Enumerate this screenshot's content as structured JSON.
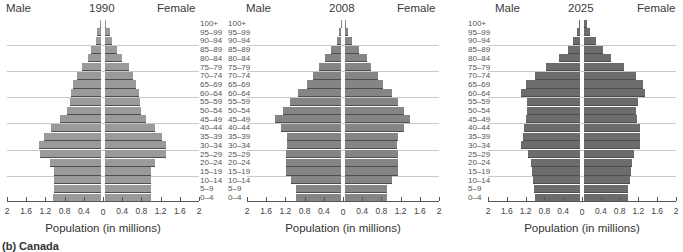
{
  "chart_data": [
    {
      "type": "bar",
      "orientation": "horizontal-pyramid",
      "title": "1990",
      "xlabel": "Population (in millions)",
      "left_label": "Male",
      "right_label": "Female",
      "xlim": [
        -2,
        2
      ],
      "x_ticks": [
        "2",
        "1.6",
        "1.2",
        "0.8",
        "0.4",
        "0",
        "0.4",
        "0.8",
        "1.2",
        "1.6",
        "2"
      ],
      "categories": [
        "100+",
        "95–99",
        "90–94",
        "85–89",
        "80–84",
        "75–79",
        "70–74",
        "65–69",
        "60–64",
        "55–59",
        "50–54",
        "45–49",
        "40–44",
        "35–39",
        "30–34",
        "25–29",
        "20–24",
        "15–19",
        "10–14",
        "5–9",
        "0–4"
      ],
      "series": [
        {
          "name": "Male",
          "values": [
            0.02,
            0.08,
            0.1,
            0.2,
            0.28,
            0.4,
            0.5,
            0.58,
            0.62,
            0.65,
            0.7,
            0.85,
            1.05,
            1.18,
            1.3,
            1.28,
            1.07,
            0.98,
            0.98,
            0.98,
            1.0
          ]
        },
        {
          "name": "Female",
          "values": [
            0.03,
            0.1,
            0.15,
            0.25,
            0.35,
            0.5,
            0.58,
            0.65,
            0.7,
            0.72,
            0.75,
            0.85,
            1.05,
            1.18,
            1.28,
            1.27,
            1.05,
            0.95,
            0.95,
            0.95,
            0.95
          ]
        }
      ],
      "bar_color": "#9a9a9a"
    },
    {
      "type": "bar",
      "orientation": "horizontal-pyramid",
      "title": "2008",
      "xlabel": "Population (in millions)",
      "left_label": "Male",
      "right_label": "Female",
      "xlim": [
        -2,
        2
      ],
      "x_ticks": [
        "2",
        "1.6",
        "1.2",
        "0.8",
        "0.4",
        "0",
        "0.4",
        "0.8",
        "1.2",
        "1.6",
        "2"
      ],
      "categories": [
        "100+",
        "95–99",
        "90–94",
        "85–89",
        "80–84",
        "75–79",
        "70–74",
        "65–69",
        "60–64",
        "55–59",
        "50–54",
        "45–49",
        "40–44",
        "35–39",
        "30–34",
        "25–29",
        "20–24",
        "15–19",
        "10–14",
        "5–9",
        "0–4"
      ],
      "series": [
        {
          "name": "Male",
          "values": [
            0.01,
            0.05,
            0.08,
            0.2,
            0.33,
            0.45,
            0.58,
            0.7,
            0.9,
            1.07,
            1.2,
            1.38,
            1.25,
            1.13,
            1.12,
            1.15,
            1.15,
            1.15,
            1.05,
            0.93,
            0.93
          ]
        },
        {
          "name": "Female",
          "values": [
            0.02,
            0.07,
            0.15,
            0.3,
            0.45,
            0.55,
            0.68,
            0.8,
            0.98,
            1.1,
            1.23,
            1.35,
            1.22,
            1.1,
            1.08,
            1.1,
            1.1,
            1.1,
            0.98,
            0.87,
            0.87
          ]
        }
      ],
      "bar_color": "#858585"
    },
    {
      "type": "bar",
      "orientation": "horizontal-pyramid",
      "title": "2025",
      "xlabel": "Population (in millions)",
      "left_label": "Male",
      "right_label": "Female",
      "xlim": [
        -2,
        2
      ],
      "x_ticks": [
        "2",
        "1.6",
        "1.2",
        "0.8",
        "0.4",
        "0",
        "0.4",
        "0.8",
        "1.2",
        "1.6",
        "2"
      ],
      "categories": [
        "100+",
        "95–99",
        "90–94",
        "85–89",
        "80–84",
        "75–79",
        "70–74",
        "65–69",
        "60–64",
        "55–59",
        "50–54",
        "45–49",
        "40–44",
        "35–39",
        "30–34",
        "25–29",
        "20–24",
        "15–19",
        "10–14",
        "5–9",
        "0–4"
      ],
      "series": [
        {
          "name": "Male",
          "values": [
            0.03,
            0.07,
            0.15,
            0.25,
            0.45,
            0.73,
            0.95,
            1.15,
            1.25,
            1.13,
            1.13,
            1.15,
            1.2,
            1.22,
            1.25,
            1.1,
            1.05,
            1.02,
            1.0,
            0.98,
            0.95
          ]
        },
        {
          "name": "Female",
          "values": [
            0.06,
            0.12,
            0.25,
            0.4,
            0.58,
            0.85,
            1.1,
            1.25,
            1.3,
            1.15,
            1.1,
            1.13,
            1.2,
            1.2,
            1.2,
            1.07,
            1.03,
            1.0,
            0.97,
            0.93,
            0.93
          ]
        }
      ],
      "bar_color": "#6c6c6c"
    }
  ],
  "caption": "(b) Canada"
}
